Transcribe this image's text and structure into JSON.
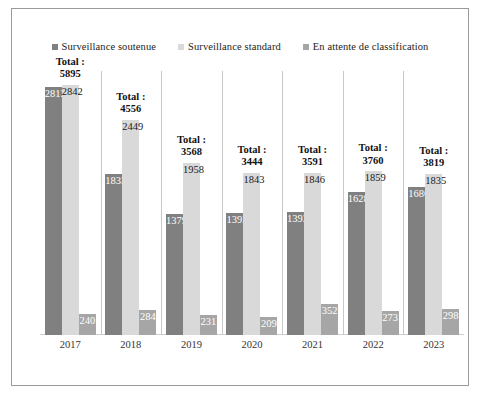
{
  "chart_data": {
    "type": "bar",
    "title": "",
    "subtitle": "",
    "xlabel": "",
    "ylabel": "",
    "categories": [
      "2017",
      "2018",
      "2019",
      "2020",
      "2021",
      "2022",
      "2023"
    ],
    "series": [
      {
        "name": "Surveillance soutenue",
        "color": "#808080",
        "values": [
          2813,
          1833,
          1379,
          1392,
          1393,
          1628,
          1686
        ]
      },
      {
        "name": "Surveillance standard",
        "color": "#d9d9d9",
        "values": [
          2842,
          2449,
          1958,
          1843,
          1846,
          1859,
          1835
        ]
      },
      {
        "name": "En attente de classification",
        "color": "#a6a6a6",
        "values": [
          240,
          284,
          231,
          209,
          352,
          273,
          298
        ]
      }
    ],
    "totals": [
      5895,
      4556,
      3568,
      3444,
      3591,
      3760,
      3819
    ],
    "total_label_prefix": "Total :",
    "ylim": [
      0,
      3000
    ],
    "grid": "vertical-category-separators",
    "legend_position": "top-center"
  },
  "legend": {
    "items": [
      {
        "label": "Surveillance soutenue",
        "color": "#808080"
      },
      {
        "label": "Surveillance standard",
        "color": "#d9d9d9"
      },
      {
        "label": "En attente de classification",
        "color": "#a6a6a6"
      }
    ]
  }
}
